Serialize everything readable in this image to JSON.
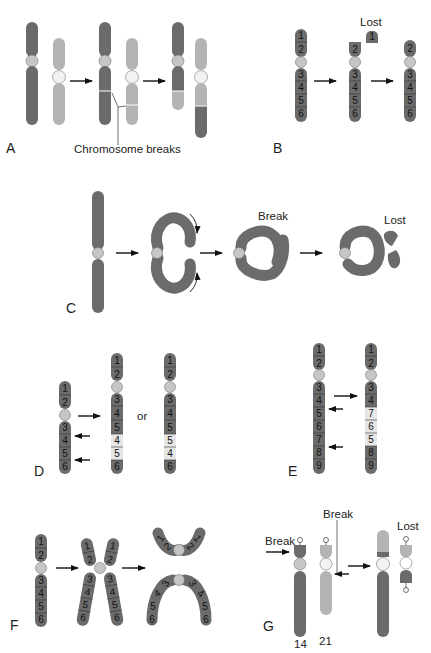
{
  "figure": {
    "colors": {
      "dark_chromosome": "#6b6b6b",
      "light_chromosome": "#b4b4b4",
      "centromere": "#c6c6c6",
      "centromere_white": "#f2f2f2",
      "inverted_segment": "#e6e6e6"
    },
    "panels": [
      {
        "id": "A",
        "letter": "A",
        "caption": "Chromosome breaks",
        "description": "Reciprocal translocation"
      },
      {
        "id": "B",
        "letter": "B",
        "caption": "Lost",
        "segments_start": [
          "1",
          "2",
          "3",
          "4",
          "5",
          "6"
        ],
        "segments_end": [
          "2",
          "3",
          "4",
          "5",
          "6"
        ],
        "lost_segment": "1",
        "description": "Terminal deletion"
      },
      {
        "id": "C",
        "letter": "C",
        "break_label": "Break",
        "lost_label": "Lost",
        "description": "Ring chromosome formation"
      },
      {
        "id": "D",
        "letter": "D",
        "or_label": "or",
        "segments_start": [
          "1",
          "2",
          "3",
          "4",
          "5",
          "6"
        ],
        "segments_option1": [
          "1",
          "2",
          "3",
          "4",
          "5",
          "4",
          "5",
          "6"
        ],
        "segments_option2": [
          "1",
          "2",
          "3",
          "4",
          "5",
          "5",
          "4",
          "6"
        ],
        "description": "Duplication"
      },
      {
        "id": "E",
        "letter": "E",
        "segments_start": [
          "1",
          "2",
          "3",
          "4",
          "5",
          "6",
          "7",
          "8",
          "9"
        ],
        "segments_end": [
          "1",
          "2",
          "3",
          "4",
          "7",
          "6",
          "5",
          "8",
          "9"
        ],
        "description": "Paracentric inversion"
      },
      {
        "id": "F",
        "letter": "F",
        "segments": [
          "1",
          "2",
          "3",
          "4",
          "5",
          "6"
        ],
        "description": "Isochromosome formation"
      },
      {
        "id": "G",
        "letter": "G",
        "break_label_left": "Break",
        "break_label_top": "Break",
        "lost_label": "Lost",
        "chromosome_labels": [
          "14",
          "21"
        ],
        "description": "Robertsonian translocation"
      }
    ]
  }
}
